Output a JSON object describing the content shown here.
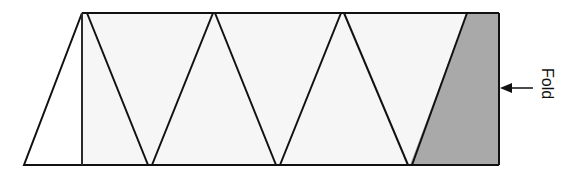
{
  "diagram": {
    "type": "fold-pattern",
    "strip": {
      "left_top_x": 82,
      "top_y": 13,
      "bottom_y": 165,
      "left_bottom_x": 24,
      "right_x": 499
    },
    "colors": {
      "stroke": "#111111",
      "panel_fill": "#f6f6f6",
      "left_triangle_fill": "#ffffff",
      "shaded_fill": "#a9a9a9"
    },
    "fold_label": "Fold",
    "triangles": [
      {
        "name": "left-triangle",
        "points": "82,13 24,165 82,165"
      },
      {
        "name": "down-triangle-1",
        "points": "88,13 212,13 149,165"
      },
      {
        "name": "up-triangle-1",
        "points": "214,13 152,165 278,165"
      },
      {
        "name": "down-triangle-2",
        "points": "216,13 340,13 278,165"
      },
      {
        "name": "up-triangle-2",
        "points": "342,13 280,165 410,165"
      },
      {
        "name": "down-triangle-3",
        "points": "345,13 467,13 410,165"
      }
    ],
    "shaded_region": {
      "points": "467,13 499,13 499,165 412,165"
    }
  }
}
